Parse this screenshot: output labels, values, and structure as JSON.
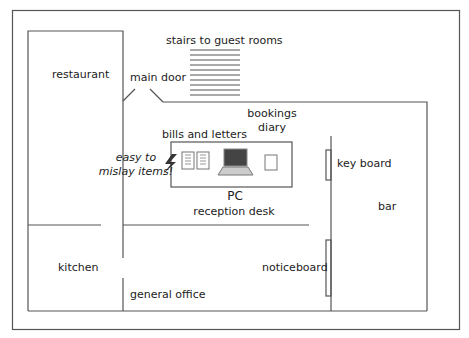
{
  "diagram": {
    "type": "floor-plan",
    "rooms": {
      "restaurant": "restaurant",
      "kitchen": "kitchen",
      "general_office": "general office",
      "bar": "bar",
      "reception_desk": "reception desk"
    },
    "labels": {
      "stairs": "stairs to guest rooms",
      "main_door": "main door",
      "bills": "bills and letters",
      "bookings_line1": "bookings",
      "bookings_line2": "diary",
      "warning_line1": "easy to",
      "warning_line2": "mislay items!",
      "pc": "PC",
      "key_board": "key board",
      "noticeboard": "noticeboard"
    },
    "colors": {
      "line": "#555555",
      "text": "#222222"
    }
  }
}
